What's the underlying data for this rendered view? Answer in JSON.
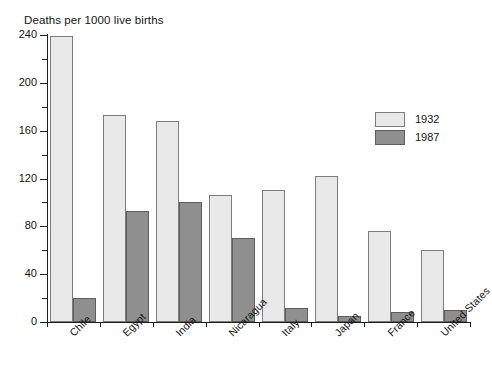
{
  "chart_data": {
    "type": "bar",
    "title": "Deaths per 1000 live births",
    "xlabel": "",
    "ylabel": "",
    "ylim": [
      0,
      240
    ],
    "yticks": [
      0,
      40,
      80,
      120,
      160,
      200,
      240
    ],
    "ytick_labels": [
      "0",
      "40",
      "80",
      "120",
      "160",
      "200",
      "240"
    ],
    "minor_tick_interval": 20,
    "grid": false,
    "legend_position": "upper right",
    "categories": [
      "Chile",
      "Egypt",
      "India",
      "Nicaragua",
      "Italy",
      "Japan",
      "France",
      "United States"
    ],
    "series": [
      {
        "name": "1932",
        "color": "#e9e9e9",
        "values": [
          239,
          173,
          168,
          106,
          110,
          122,
          76,
          60
        ]
      },
      {
        "name": "1987",
        "color": "#8f8f8f",
        "values": [
          20,
          93,
          100,
          70,
          12,
          5,
          8,
          10
        ]
      }
    ]
  },
  "legend": {
    "entries": [
      {
        "label": "1932"
      },
      {
        "label": "1987"
      }
    ]
  },
  "colors": {
    "series_1932": "#e9e9e9",
    "series_1987": "#8f8f8f",
    "axis": "#1d1d1d",
    "text": "#151515",
    "background": "#ffffff"
  }
}
